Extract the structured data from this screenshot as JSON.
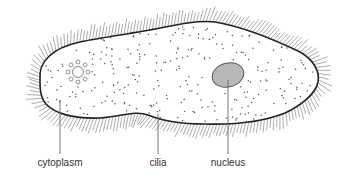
{
  "colors": {
    "outline": "#222222",
    "cilia": "#8a8a8a",
    "cytoplasm_fill": "#ffffff",
    "nucleus_fill": "#b8b8b8",
    "nucleus_stroke": "#555555",
    "leader": "#666666",
    "text": "#333333"
  },
  "labels": {
    "cytoplasm": "cytoplasm",
    "cilia": "cilia",
    "nucleus": "nucleus"
  },
  "parts": [
    {
      "id": "cytoplasm",
      "label": "cytoplasm",
      "text_x": 60,
      "text_y": 166,
      "line": [
        60,
        100,
        60,
        154
      ]
    },
    {
      "id": "cilia",
      "label": "cilia",
      "text_x": 158,
      "text_y": 166,
      "line": [
        158,
        114,
        158,
        154
      ]
    },
    {
      "id": "nucleus",
      "label": "nucleus",
      "text_x": 228,
      "text_y": 166,
      "line": [
        228,
        80,
        228,
        154
      ]
    }
  ],
  "nucleus": {
    "cx": 228,
    "cy": 75,
    "rx": 16,
    "ry": 12,
    "rotate": -15
  },
  "contractile_vacuole": {
    "cx": 78,
    "cy": 72,
    "r": 5.5,
    "ring_r": 10,
    "satellites": 8,
    "satellite_r": 2
  }
}
